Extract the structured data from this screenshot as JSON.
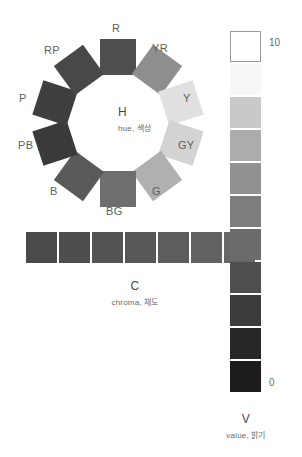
{
  "diagram": {
    "background": "#ffffff"
  },
  "hue": {
    "symbol": "H",
    "caption": "hue, 색상",
    "center": {
      "x": 118,
      "y": 123
    },
    "radius": 66,
    "swatch_size": 36,
    "segments": [
      {
        "code": "R",
        "label": "R",
        "color": "#4f4f4f",
        "angle": 0,
        "rotation": 0,
        "label_x": 112,
        "label_y": 22
      },
      {
        "code": "YR",
        "label": "YR",
        "color": "#8e8e8e",
        "angle": 36,
        "rotation": 36,
        "label_x": 152,
        "label_y": 42
      },
      {
        "code": "Y",
        "label": "Y",
        "color": "#e0e0e0",
        "angle": 72,
        "rotation": 72,
        "label_x": 183,
        "label_y": 92
      },
      {
        "code": "GY",
        "label": "GY",
        "color": "#d3d3d3",
        "angle": 108,
        "rotation": 108,
        "label_x": 178,
        "label_y": 139
      },
      {
        "code": "G",
        "label": "G",
        "color": "#b0b0b0",
        "angle": 144,
        "rotation": 144,
        "label_x": 152,
        "label_y": 185
      },
      {
        "code": "BG",
        "label": "BG",
        "color": "#6e6e6e",
        "angle": 180,
        "rotation": 0,
        "label_x": 106,
        "label_y": 205
      },
      {
        "code": "B",
        "label": "B",
        "color": "#5a5a5a",
        "angle": 216,
        "rotation": 36,
        "label_x": 50,
        "label_y": 185
      },
      {
        "code": "PB",
        "label": "PB",
        "color": "#3a3a3a",
        "angle": 252,
        "rotation": 72,
        "label_x": 18,
        "label_y": 139
      },
      {
        "code": "P",
        "label": "P",
        "color": "#3f3f3f",
        "angle": 288,
        "rotation": 108,
        "label_x": 19,
        "label_y": 92
      },
      {
        "code": "RP",
        "label": "RP",
        "color": "#484848",
        "angle": 324,
        "rotation": 144,
        "label_x": 44,
        "label_y": 44
      }
    ]
  },
  "chroma": {
    "symbol": "C",
    "caption": "chroma, 채도",
    "swatches": [
      {
        "color": "#4a4a4a"
      },
      {
        "color": "#4e4e4e"
      },
      {
        "color": "#535353"
      },
      {
        "color": "#585858"
      },
      {
        "color": "#5d5d5d"
      },
      {
        "color": "#626262"
      },
      {
        "color": "#676767"
      }
    ]
  },
  "value": {
    "symbol": "V",
    "caption": "value, 밝기",
    "tick_top": "10",
    "tick_bottom": "0",
    "swatches": [
      {
        "color": "#ffffff",
        "outlined": true
      },
      {
        "color": "#f7f7f7",
        "outlined": false
      },
      {
        "color": "#c9c9c9",
        "outlined": false
      },
      {
        "color": "#acacac",
        "outlined": false
      },
      {
        "color": "#919191",
        "outlined": false
      },
      {
        "color": "#7d7d7d",
        "outlined": false
      },
      {
        "color": "#6b6b6b",
        "outlined": false
      },
      {
        "color": "#4f4f4f",
        "outlined": false
      },
      {
        "color": "#3b3b3b",
        "outlined": false
      },
      {
        "color": "#272727",
        "outlined": false
      },
      {
        "color": "#1c1c1c",
        "outlined": false
      }
    ]
  }
}
